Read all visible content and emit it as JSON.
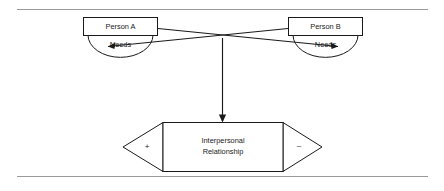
{
  "figure": {
    "background_color": "#ffffff",
    "line_color": "#1a1a1a",
    "rule_color": "#9a9a9a"
  },
  "rules": {
    "top_label": "top-divider-rule",
    "bottom_label": "bottom-divider-rule"
  },
  "nodes": {
    "person_a": {
      "label": "Person A",
      "needs_label": "Needs"
    },
    "person_b": {
      "label": "Person B",
      "needs_label": "Needs"
    },
    "relationship": {
      "line1": "Interpersonal",
      "line2": "Relationship",
      "positive_sign": "+",
      "negative_sign": "–"
    }
  },
  "connectors": [
    {
      "name": "person-a-to-person-b-needs",
      "from": "Person A",
      "to": "Person B Needs",
      "direction": "arrow"
    },
    {
      "name": "person-b-to-person-a-needs",
      "from": "Person B",
      "to": "Person A Needs",
      "direction": "arrow"
    },
    {
      "name": "crossing-to-relationship",
      "from": "crossing point",
      "to": "Interpersonal Relationship",
      "direction": "arrow"
    }
  ]
}
